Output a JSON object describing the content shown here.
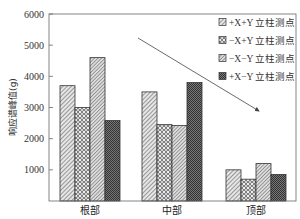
{
  "chart_data": {
    "type": "bar",
    "title": "",
    "xlabel": "",
    "ylabel": "响应谱峰值(g)",
    "ylim": [
      0,
      6000
    ],
    "yticks": [
      1000,
      2000,
      3000,
      4000,
      5000,
      6000
    ],
    "grid": false,
    "legend_position": "upper right",
    "categories": [
      "根部",
      "中部",
      "顶部"
    ],
    "series": [
      {
        "name": "+X+Y 立柱测点",
        "pattern": "diag-hatch",
        "values": [
          3700,
          3500,
          1000
        ]
      },
      {
        "name": "−X+Y 立柱测点",
        "pattern": "circles",
        "values": [
          3000,
          2450,
          700
        ]
      },
      {
        "name": "−X−Y 立柱测点",
        "pattern": "diag-hatch-fine",
        "values": [
          4600,
          2420,
          1200
        ]
      },
      {
        "name": "+X−Y 立柱测点",
        "pattern": "checker-dark",
        "values": [
          2580,
          3800,
          850
        ]
      }
    ],
    "annotations": [
      {
        "type": "arrow",
        "description": "decreasing trend arrow from upper-left to lower-right",
        "from_px": [
          138,
          38
        ],
        "to_px": [
          259,
          111
        ]
      }
    ]
  },
  "colors": {
    "axis": "#555555",
    "bar_stroke": "#333333",
    "hatch": "#444444",
    "dark_fill": "#555555"
  }
}
